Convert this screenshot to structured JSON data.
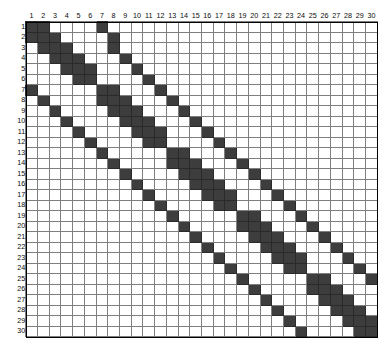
{
  "figure": {
    "title": "",
    "kind": "matrix-sparsity-pattern",
    "grid_color": "#7e7e7e",
    "filled_color": "#3d3d3d",
    "empty_color": "#ffffff",
    "frame_color": "#000000"
  },
  "chart_data": {
    "type": "heatmap",
    "title": "",
    "subtitle": "",
    "xlabel": "",
    "ylabel": "",
    "grid": true,
    "legend": "none",
    "n_rows": 30,
    "n_cols": 30,
    "value_legend": {
      "0": "empty cell (white)",
      "1": "nonzero entry (dark grey)"
    },
    "column_labels": [
      "1",
      "2",
      "3",
      "4",
      "5",
      "6",
      "7",
      "8",
      "9",
      "10",
      "11",
      "12",
      "13",
      "14",
      "15",
      "16",
      "17",
      "18",
      "19",
      "20",
      "21",
      "22",
      "23",
      "24",
      "25",
      "26",
      "27",
      "28",
      "29",
      "30"
    ],
    "row_labels": [
      "1",
      "2",
      "3",
      "4",
      "5",
      "6",
      "7",
      "8",
      "9",
      "10",
      "11",
      "12",
      "13",
      "14",
      "15",
      "16",
      "17",
      "18",
      "19",
      "20",
      "21",
      "22",
      "23",
      "24",
      "25",
      "26",
      "27",
      "28",
      "29",
      "30"
    ],
    "xlim": [
      1,
      30
    ],
    "ylim": [
      1,
      30
    ],
    "values": [
      [
        1,
        1,
        0,
        0,
        0,
        0,
        1,
        0,
        0,
        0,
        0,
        0,
        0,
        0,
        0,
        0,
        0,
        0,
        0,
        0,
        0,
        0,
        0,
        0,
        0,
        0,
        0,
        0,
        0,
        0
      ],
      [
        1,
        1,
        1,
        0,
        0,
        0,
        0,
        1,
        0,
        0,
        0,
        0,
        0,
        0,
        0,
        0,
        0,
        0,
        0,
        0,
        0,
        0,
        0,
        0,
        0,
        0,
        0,
        0,
        0,
        0
      ],
      [
        0,
        1,
        1,
        1,
        0,
        0,
        0,
        1,
        0,
        0,
        0,
        0,
        0,
        0,
        0,
        0,
        0,
        0,
        0,
        0,
        0,
        0,
        0,
        0,
        0,
        0,
        0,
        0,
        0,
        0
      ],
      [
        0,
        0,
        1,
        1,
        1,
        0,
        0,
        0,
        1,
        0,
        0,
        0,
        0,
        0,
        0,
        0,
        0,
        0,
        0,
        0,
        0,
        0,
        0,
        0,
        0,
        0,
        0,
        0,
        0,
        0
      ],
      [
        0,
        0,
        0,
        1,
        1,
        1,
        0,
        0,
        0,
        1,
        0,
        0,
        0,
        0,
        0,
        0,
        0,
        0,
        0,
        0,
        0,
        0,
        0,
        0,
        0,
        0,
        0,
        0,
        0,
        0
      ],
      [
        0,
        0,
        0,
        0,
        1,
        1,
        0,
        0,
        0,
        0,
        1,
        0,
        0,
        0,
        0,
        0,
        0,
        0,
        0,
        0,
        0,
        0,
        0,
        0,
        0,
        0,
        0,
        0,
        0,
        0
      ],
      [
        1,
        0,
        0,
        0,
        0,
        0,
        1,
        1,
        0,
        0,
        0,
        1,
        0,
        0,
        0,
        0,
        0,
        0,
        0,
        0,
        0,
        0,
        0,
        0,
        0,
        0,
        0,
        0,
        0,
        0
      ],
      [
        0,
        1,
        0,
        0,
        0,
        0,
        1,
        1,
        1,
        0,
        0,
        0,
        1,
        0,
        0,
        0,
        0,
        0,
        0,
        0,
        0,
        0,
        0,
        0,
        0,
        0,
        0,
        0,
        0,
        0
      ],
      [
        0,
        0,
        1,
        0,
        0,
        0,
        0,
        1,
        1,
        1,
        0,
        0,
        0,
        1,
        0,
        0,
        0,
        0,
        0,
        0,
        0,
        0,
        0,
        0,
        0,
        0,
        0,
        0,
        0,
        0
      ],
      [
        0,
        0,
        0,
        1,
        0,
        0,
        0,
        0,
        1,
        1,
        1,
        0,
        0,
        0,
        1,
        0,
        0,
        0,
        0,
        0,
        0,
        0,
        0,
        0,
        0,
        0,
        0,
        0,
        0,
        0
      ],
      [
        0,
        0,
        0,
        0,
        1,
        0,
        0,
        0,
        0,
        1,
        1,
        1,
        0,
        0,
        0,
        1,
        0,
        0,
        0,
        0,
        0,
        0,
        0,
        0,
        0,
        0,
        0,
        0,
        0,
        0
      ],
      [
        0,
        0,
        0,
        0,
        0,
        1,
        0,
        0,
        0,
        0,
        1,
        1,
        0,
        0,
        0,
        0,
        1,
        0,
        0,
        0,
        0,
        0,
        0,
        0,
        0,
        0,
        0,
        0,
        0,
        0
      ],
      [
        0,
        0,
        0,
        0,
        0,
        0,
        1,
        0,
        0,
        0,
        0,
        0,
        1,
        1,
        0,
        0,
        0,
        1,
        0,
        0,
        0,
        0,
        0,
        0,
        0,
        0,
        0,
        0,
        0,
        0
      ],
      [
        0,
        0,
        0,
        0,
        0,
        0,
        0,
        1,
        0,
        0,
        0,
        0,
        1,
        1,
        1,
        0,
        0,
        0,
        1,
        0,
        0,
        0,
        0,
        0,
        0,
        0,
        0,
        0,
        0,
        0
      ],
      [
        0,
        0,
        0,
        0,
        0,
        0,
        0,
        0,
        1,
        0,
        0,
        0,
        0,
        1,
        1,
        1,
        0,
        0,
        0,
        1,
        0,
        0,
        0,
        0,
        0,
        0,
        0,
        0,
        0,
        0
      ],
      [
        0,
        0,
        0,
        0,
        0,
        0,
        0,
        0,
        0,
        1,
        0,
        0,
        0,
        0,
        1,
        1,
        1,
        0,
        0,
        0,
        1,
        0,
        0,
        0,
        0,
        0,
        0,
        0,
        0,
        0
      ],
      [
        0,
        0,
        0,
        0,
        0,
        0,
        0,
        0,
        0,
        0,
        1,
        0,
        0,
        0,
        0,
        1,
        1,
        1,
        0,
        0,
        0,
        1,
        0,
        0,
        0,
        0,
        0,
        0,
        0,
        0
      ],
      [
        0,
        0,
        0,
        0,
        0,
        0,
        0,
        0,
        0,
        0,
        0,
        1,
        0,
        0,
        0,
        0,
        1,
        1,
        0,
        0,
        0,
        0,
        1,
        0,
        0,
        0,
        0,
        0,
        0,
        0
      ],
      [
        0,
        0,
        0,
        0,
        0,
        0,
        0,
        0,
        0,
        0,
        0,
        0,
        1,
        0,
        0,
        0,
        0,
        0,
        1,
        1,
        0,
        0,
        0,
        1,
        0,
        0,
        0,
        0,
        0,
        0
      ],
      [
        0,
        0,
        0,
        0,
        0,
        0,
        0,
        0,
        0,
        0,
        0,
        0,
        0,
        1,
        0,
        0,
        0,
        0,
        1,
        1,
        1,
        0,
        0,
        0,
        1,
        0,
        0,
        0,
        0,
        0
      ],
      [
        0,
        0,
        0,
        0,
        0,
        0,
        0,
        0,
        0,
        0,
        0,
        0,
        0,
        0,
        1,
        0,
        0,
        0,
        0,
        1,
        1,
        1,
        0,
        0,
        0,
        1,
        0,
        0,
        0,
        0
      ],
      [
        0,
        0,
        0,
        0,
        0,
        0,
        0,
        0,
        0,
        0,
        0,
        0,
        0,
        0,
        0,
        1,
        0,
        0,
        0,
        0,
        1,
        1,
        1,
        0,
        0,
        0,
        1,
        0,
        0,
        0
      ],
      [
        0,
        0,
        0,
        0,
        0,
        0,
        0,
        0,
        0,
        0,
        0,
        0,
        0,
        0,
        0,
        0,
        1,
        0,
        0,
        0,
        0,
        1,
        1,
        1,
        0,
        0,
        0,
        1,
        0,
        0
      ],
      [
        0,
        0,
        0,
        0,
        0,
        0,
        0,
        0,
        0,
        0,
        0,
        0,
        0,
        0,
        0,
        0,
        0,
        1,
        0,
        0,
        0,
        0,
        1,
        1,
        0,
        0,
        0,
        0,
        1,
        0
      ],
      [
        0,
        0,
        0,
        0,
        0,
        0,
        0,
        0,
        0,
        0,
        0,
        0,
        0,
        0,
        0,
        0,
        0,
        0,
        1,
        0,
        0,
        0,
        0,
        0,
        1,
        1,
        0,
        0,
        0,
        1
      ],
      [
        0,
        0,
        0,
        0,
        0,
        0,
        0,
        0,
        0,
        0,
        0,
        0,
        0,
        0,
        0,
        0,
        0,
        0,
        0,
        1,
        0,
        0,
        0,
        0,
        1,
        1,
        1,
        0,
        0,
        0
      ],
      [
        0,
        0,
        0,
        0,
        0,
        0,
        0,
        0,
        0,
        0,
        0,
        0,
        0,
        0,
        0,
        0,
        0,
        0,
        0,
        0,
        1,
        0,
        0,
        0,
        0,
        1,
        1,
        1,
        0,
        0
      ],
      [
        0,
        0,
        0,
        0,
        0,
        0,
        0,
        0,
        0,
        0,
        0,
        0,
        0,
        0,
        0,
        0,
        0,
        0,
        0,
        0,
        0,
        1,
        0,
        0,
        0,
        0,
        1,
        1,
        1,
        0
      ],
      [
        0,
        0,
        0,
        0,
        0,
        0,
        0,
        0,
        0,
        0,
        0,
        0,
        0,
        0,
        0,
        0,
        0,
        0,
        0,
        0,
        0,
        0,
        1,
        0,
        0,
        0,
        0,
        1,
        1,
        1
      ],
      [
        0,
        0,
        0,
        0,
        0,
        0,
        0,
        0,
        0,
        0,
        0,
        0,
        0,
        0,
        0,
        0,
        0,
        0,
        0,
        0,
        0,
        0,
        0,
        1,
        0,
        0,
        0,
        0,
        1,
        1
      ]
    ]
  }
}
